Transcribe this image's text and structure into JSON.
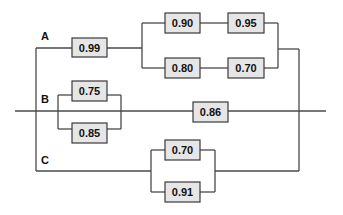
{
  "diagram": {
    "colors": {
      "wire": "#4a4a4a",
      "box_fill": "#e6e6e6",
      "box_stroke": "#3a3a3a",
      "text": "#111111"
    },
    "paths": [
      {
        "label": "A",
        "components": [
          {
            "id": "a1",
            "value": "0.99"
          },
          {
            "id": "a2",
            "value": "0.90"
          },
          {
            "id": "a3",
            "value": "0.95"
          },
          {
            "id": "a4",
            "value": "0.80"
          },
          {
            "id": "a5",
            "value": "0.70"
          }
        ]
      },
      {
        "label": "B",
        "components": [
          {
            "id": "b1",
            "value": "0.75"
          },
          {
            "id": "b2",
            "value": "0.85"
          },
          {
            "id": "b3",
            "value": "0.86"
          }
        ]
      },
      {
        "label": "C",
        "components": [
          {
            "id": "c1",
            "value": "0.70"
          },
          {
            "id": "c2",
            "value": "0.91"
          }
        ]
      }
    ]
  }
}
